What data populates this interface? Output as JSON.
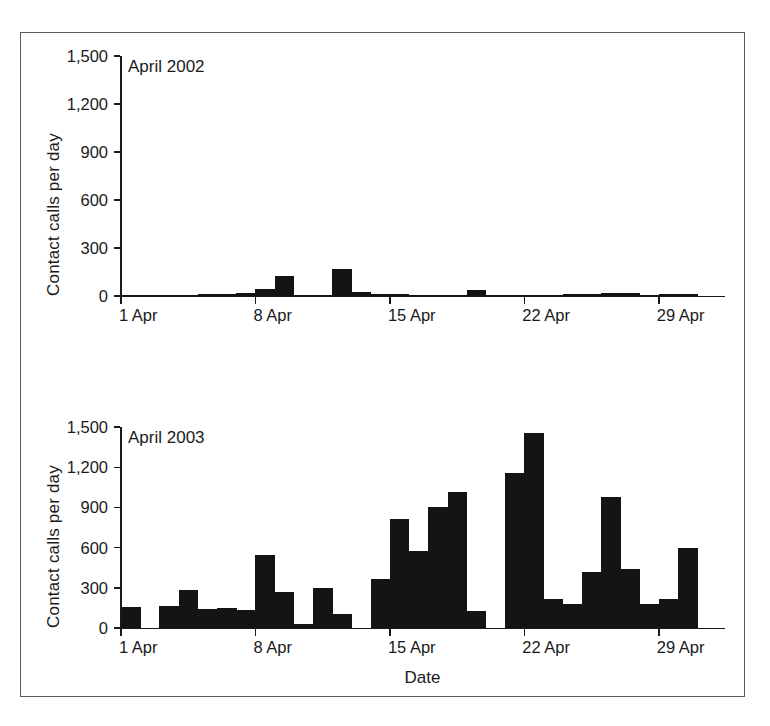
{
  "figure": {
    "x_axis_title": "Date",
    "y_axis_title": "Contact calls per day"
  },
  "chart_data": [
    {
      "type": "bar",
      "title": "April 2002",
      "xlabel": "",
      "ylabel": "Contact calls per day",
      "ylim": [
        0,
        1500
      ],
      "yticks": [
        "0",
        "300",
        "600",
        "900",
        "1,200",
        "1,500"
      ],
      "ytick_values": [
        0,
        300,
        600,
        900,
        1200,
        1500
      ],
      "xticks": [
        "1 Apr",
        "8 Apr",
        "15 Apr",
        "22 Apr",
        "29 Apr"
      ],
      "xtick_days": [
        1,
        8,
        15,
        22,
        29
      ],
      "grid": false,
      "legend": "none",
      "bar_color": "#141414",
      "categories": [
        1,
        2,
        3,
        4,
        5,
        6,
        7,
        8,
        9,
        10,
        11,
        12,
        13,
        14,
        15,
        16,
        17,
        18,
        19,
        20,
        21,
        22,
        23,
        24,
        25,
        26,
        27,
        28,
        29,
        30
      ],
      "values": [
        8,
        8,
        5,
        5,
        10,
        12,
        20,
        45,
        125,
        8,
        8,
        170,
        25,
        12,
        10,
        8,
        5,
        5,
        35,
        5,
        5,
        5,
        5,
        15,
        15,
        20,
        20,
        5,
        10,
        10
      ]
    },
    {
      "type": "bar",
      "title": "April 2003",
      "xlabel": "Date",
      "ylabel": "Contact calls per day",
      "ylim": [
        0,
        1500
      ],
      "yticks": [
        "0",
        "300",
        "600",
        "900",
        "1,200",
        "1,500"
      ],
      "ytick_values": [
        0,
        300,
        600,
        900,
        1200,
        1500
      ],
      "xticks": [
        "1 Apr",
        "8 Apr",
        "15 Apr",
        "22 Apr",
        "29 Apr"
      ],
      "xtick_days": [
        1,
        8,
        15,
        22,
        29
      ],
      "grid": false,
      "legend": "none",
      "bar_color": "#141414",
      "categories": [
        1,
        2,
        3,
        4,
        5,
        6,
        7,
        8,
        9,
        10,
        11,
        12,
        13,
        14,
        15,
        16,
        17,
        18,
        19,
        20,
        21,
        22,
        23,
        24,
        25,
        26,
        27,
        28,
        29,
        30
      ],
      "values": [
        160,
        0,
        165,
        285,
        140,
        150,
        135,
        545,
        270,
        30,
        300,
        105,
        0,
        365,
        810,
        575,
        900,
        1015,
        130,
        0,
        1155,
        1455,
        215,
        180,
        415,
        980,
        440,
        180,
        215,
        600
      ]
    }
  ]
}
